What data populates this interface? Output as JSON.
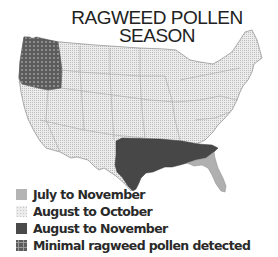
{
  "title": {
    "line1": "RAGWEED POLLEN",
    "line2": "SEASON"
  },
  "map": {
    "region": "Contiguous United States",
    "regions": [
      {
        "name": "Pacific Northwest (Washington, Oregon)",
        "category": "Minimal ragweed pollen detected"
      },
      {
        "name": "South Central / Southeast (Texas, Oklahoma, Arkansas, Louisiana, Mississippi, Alabama, Georgia, South Carolina)",
        "category": "August to November"
      },
      {
        "name": "Florida",
        "category": "July to November"
      },
      {
        "name": "Rest of contiguous US",
        "category": "August to October"
      }
    ]
  },
  "legend": {
    "items": [
      {
        "label": "July to November",
        "swatch": "light-gray",
        "color": "#b4b4b4"
      },
      {
        "label": "August to October",
        "swatch": "dotted",
        "color": "#e6e6e6"
      },
      {
        "label": "August to November",
        "swatch": "dark-gray",
        "color": "#4a4a4a"
      },
      {
        "label": "Minimal ragweed pollen detected",
        "swatch": "grid",
        "color": "#6a6a6a"
      }
    ]
  },
  "colors": {
    "land_dotted": "#e4e4e4",
    "dark": "#4a4a4a",
    "florida": "#b0b0b0",
    "grid_bg": "#5e5e5e",
    "border": "#888888"
  }
}
